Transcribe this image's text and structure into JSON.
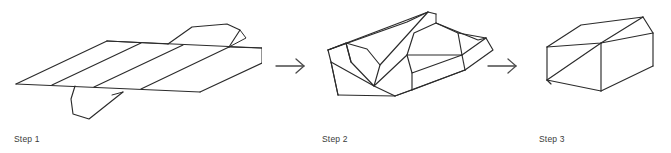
{
  "figure": {
    "background_color": "#ffffff",
    "line_color": "#2b2b2b",
    "arrow_color": "#4a4a4a",
    "label_color": "#3a3a3a",
    "orientation": "horizontal",
    "step_count": 3
  },
  "steps": [
    {
      "id": "step1",
      "label": "Step 1",
      "caption": "Step 1",
      "description": "Flat unfolded cardboard net lying open, shown in oblique projection with parallel crease lines and end flaps",
      "diagram_type": "flat-net"
    },
    {
      "id": "step2",
      "label": "Step 2",
      "caption": "Step 2",
      "description": "Partially folded box with side walls raised and end flaps turned up",
      "diagram_type": "partially-folded-box"
    },
    {
      "id": "step3",
      "label": "Step 3",
      "caption": "Step 3",
      "description": "Completed closed rectangular box in isometric wireframe view",
      "diagram_type": "closed-box"
    }
  ],
  "arrows": [
    {
      "id": "arrow-1",
      "icon": "arrow-right-icon",
      "from": "step1",
      "to": "step2"
    },
    {
      "id": "arrow-2",
      "icon": "arrow-right-icon",
      "from": "step2",
      "to": "step3"
    }
  ]
}
